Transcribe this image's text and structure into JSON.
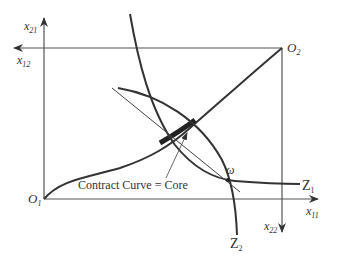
{
  "diagram": {
    "axes": {
      "x11": {
        "label": "x",
        "sub": "11"
      },
      "x21": {
        "label": "x",
        "sub": "21"
      },
      "x12": {
        "label": "x",
        "sub": "12"
      },
      "x22": {
        "label": "x",
        "sub": "22"
      }
    },
    "origins": {
      "o1": {
        "label": "O",
        "sub": "1"
      },
      "o2": {
        "label": "O",
        "sub": "2"
      }
    },
    "curves": {
      "z1": {
        "label": "Z",
        "sub": "1"
      },
      "z2": {
        "label": "Z",
        "sub": "2"
      }
    },
    "endowment_label": "ω",
    "annotation": "Contract Curve = Core",
    "colors": {
      "line": "#333333",
      "axis": "#555555"
    }
  }
}
